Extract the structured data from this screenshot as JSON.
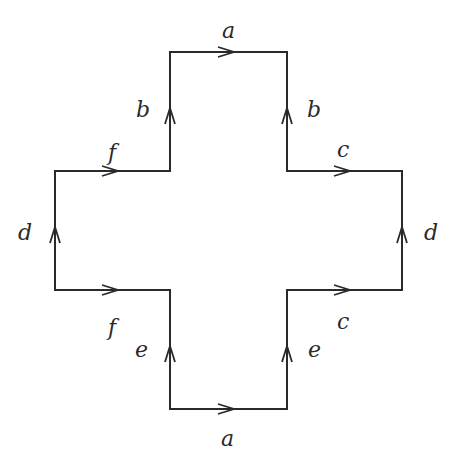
{
  "diagram": {
    "stroke_color": "#2a2a2a",
    "background": "#ffffff",
    "labels": {
      "top_a": "a",
      "bottom_a": "a",
      "upper_left_b": "b",
      "upper_right_b": "b",
      "upper_left_f": "f",
      "lower_left_f": "f",
      "upper_right_c": "c",
      "lower_right_c": "c",
      "left_d": "d",
      "right_d": "d",
      "lower_left_e": "e",
      "lower_right_e": "e"
    },
    "edges": [
      {
        "label": "a",
        "from": [
          170,
          52
        ],
        "to": [
          287,
          52
        ],
        "arrow": "right"
      },
      {
        "label": "b",
        "from": [
          170,
          171
        ],
        "to": [
          170,
          52
        ],
        "arrow": "up"
      },
      {
        "label": "b",
        "from": [
          287,
          171
        ],
        "to": [
          287,
          52
        ],
        "arrow": "up"
      },
      {
        "label": "f",
        "from": [
          55,
          171
        ],
        "to": [
          170,
          171
        ],
        "arrow": "right"
      },
      {
        "label": "c",
        "from": [
          287,
          171
        ],
        "to": [
          402,
          171
        ],
        "arrow": "right"
      },
      {
        "label": "d",
        "from": [
          55,
          290
        ],
        "to": [
          55,
          171
        ],
        "arrow": "up"
      },
      {
        "label": "d",
        "from": [
          402,
          290
        ],
        "to": [
          402,
          171
        ],
        "arrow": "up"
      },
      {
        "label": "f",
        "from": [
          55,
          290
        ],
        "to": [
          170,
          290
        ],
        "arrow": "right"
      },
      {
        "label": "c",
        "from": [
          287,
          290
        ],
        "to": [
          402,
          290
        ],
        "arrow": "right"
      },
      {
        "label": "e",
        "from": [
          170,
          409
        ],
        "to": [
          170,
          290
        ],
        "arrow": "up"
      },
      {
        "label": "e",
        "from": [
          287,
          409
        ],
        "to": [
          287,
          290
        ],
        "arrow": "up"
      },
      {
        "label": "a",
        "from": [
          170,
          409
        ],
        "to": [
          287,
          409
        ],
        "arrow": "right"
      }
    ]
  }
}
